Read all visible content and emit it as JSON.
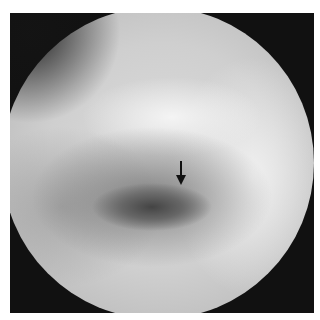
{
  "image": {
    "description": "Radiograph with circular field of view on dark background",
    "annotation": {
      "type": "arrow",
      "direction": "down",
      "color": "#111111"
    },
    "colors": {
      "frame": "#111111",
      "field_light": "#e6e6e6",
      "field_dark": "#555555"
    }
  }
}
